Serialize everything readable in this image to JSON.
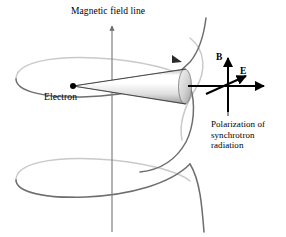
{
  "figure": {
    "title": "Magnetic field line",
    "background_color": "#ffffff"
  },
  "labels": {
    "magnetic_field_line": "Magnetic field line",
    "electron": "Electron",
    "b_vector": "B",
    "e_vector": "E",
    "polarization_line1": "Polarization of",
    "polarization_line2": "synchrotron",
    "polarization_line3": "radiation"
  },
  "colors": {
    "ink": "#000000",
    "helix_dark": "#6e6e6e",
    "helix_light": "#c9c9c9",
    "axis": "#808080",
    "cone_light": "#ffffff",
    "cone_mid": "#e9e9e9",
    "cone_shade": "#a8a8a8"
  },
  "geometry": {
    "canvas_width": 286,
    "canvas_height": 237,
    "electron_point": [
      73,
      86
    ],
    "cone_cap_center": [
      186,
      86
    ],
    "vector_origin": [
      228,
      86
    ],
    "field_axis_x": 112
  }
}
